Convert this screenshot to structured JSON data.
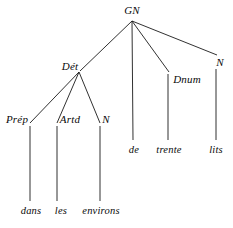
{
  "figure": {
    "kind": "syntax-tree",
    "sentence": "dans les environs de trente lits",
    "background_color": "#ffffff",
    "edge_color": "#1a1a1a",
    "text_color": "#0a0a0a",
    "width": 233,
    "height": 228
  },
  "nodes": {
    "gn": {
      "label": "GN",
      "x": 132,
      "y": 10
    },
    "det": {
      "label": "Dét",
      "x": 70,
      "y": 66
    },
    "dnum": {
      "label": "Dnum",
      "x": 187,
      "y": 79
    },
    "n_right": {
      "label": "N",
      "x": 220,
      "y": 62
    },
    "prep": {
      "label": "Prép",
      "x": 17,
      "y": 119
    },
    "artd": {
      "label": "Artd",
      "x": 70,
      "y": 119
    },
    "n_det": {
      "label": "N",
      "x": 106,
      "y": 119
    },
    "de": {
      "label": "de",
      "x": 134,
      "y": 150
    },
    "trente": {
      "label": "trente",
      "x": 169,
      "y": 150
    },
    "lits": {
      "label": "lits",
      "x": 216,
      "y": 150
    },
    "dans": {
      "label": "dans",
      "x": 31,
      "y": 211
    },
    "les": {
      "label": "les",
      "x": 61,
      "y": 211
    },
    "environs": {
      "label": "environs",
      "x": 101,
      "y": 211
    }
  },
  "edges": [
    {
      "from": "gn",
      "to": "det",
      "x1": 132,
      "y1": 21,
      "x2": 80,
      "y2": 71
    },
    {
      "from": "gn",
      "to": "de",
      "x1": 132,
      "y1": 21,
      "x2": 133,
      "y2": 140
    },
    {
      "from": "gn",
      "to": "dnum",
      "x1": 132,
      "y1": 21,
      "x2": 169,
      "y2": 72
    },
    {
      "from": "gn",
      "to": "n_right",
      "x1": 132,
      "y1": 21,
      "x2": 217,
      "y2": 55
    },
    {
      "from": "det",
      "to": "prep",
      "x1": 79,
      "y1": 72,
      "x2": 30,
      "y2": 123
    },
    {
      "from": "det",
      "to": "artd",
      "x1": 79,
      "y1": 72,
      "x2": 57,
      "y2": 123
    },
    {
      "from": "det",
      "to": "n_det",
      "x1": 79,
      "y1": 72,
      "x2": 100,
      "y2": 123
    },
    {
      "from": "dnum",
      "to": "trente",
      "x1": 168,
      "y1": 74,
      "x2": 168,
      "y2": 140
    },
    {
      "from": "n_right",
      "to": "lits",
      "x1": 216,
      "y1": 69,
      "x2": 216,
      "y2": 140
    },
    {
      "from": "prep",
      "to": "dans",
      "x1": 30,
      "y1": 126,
      "x2": 30,
      "y2": 201
    },
    {
      "from": "artd",
      "to": "les",
      "x1": 57,
      "y1": 126,
      "x2": 57,
      "y2": 201
    },
    {
      "from": "n_det",
      "to": "environs",
      "x1": 100,
      "y1": 126,
      "x2": 100,
      "y2": 201
    }
  ]
}
